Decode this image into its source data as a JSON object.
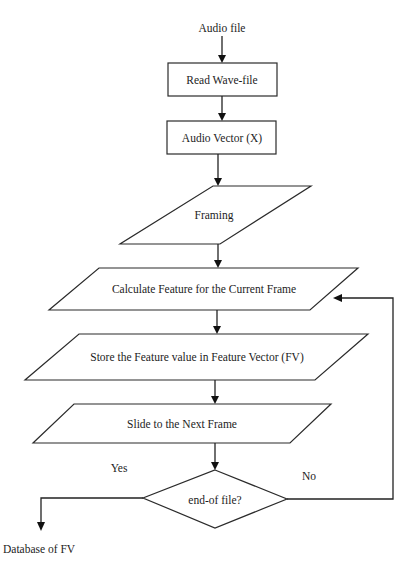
{
  "diagram": {
    "type": "flowchart",
    "colors": {
      "stroke": "#2b2b2b",
      "fill": "#ffffff",
      "text": "#1c1c1c"
    },
    "start_label": "Audio file",
    "nodes": [
      {
        "id": "read_wave",
        "shape": "rectangle",
        "label": "Read Wave-file"
      },
      {
        "id": "audio_vector",
        "shape": "rectangle",
        "label": "Audio Vector (X)"
      },
      {
        "id": "framing",
        "shape": "parallelogram",
        "label": "Framing"
      },
      {
        "id": "calc_feature",
        "shape": "parallelogram",
        "label": "Calculate Feature for the Current Frame"
      },
      {
        "id": "store_feature",
        "shape": "parallelogram",
        "label": "Store the Feature value in Feature Vector (FV)"
      },
      {
        "id": "slide_frame",
        "shape": "parallelogram",
        "label": "Slide to the Next Frame"
      },
      {
        "id": "end_of_file",
        "shape": "diamond",
        "label": "end-of file?"
      }
    ],
    "edges": [
      {
        "from": "start",
        "to": "read_wave",
        "label": ""
      },
      {
        "from": "read_wave",
        "to": "audio_vector",
        "label": ""
      },
      {
        "from": "audio_vector",
        "to": "framing",
        "label": ""
      },
      {
        "from": "framing",
        "to": "calc_feature",
        "label": ""
      },
      {
        "from": "calc_feature",
        "to": "store_feature",
        "label": ""
      },
      {
        "from": "store_feature",
        "to": "slide_frame",
        "label": ""
      },
      {
        "from": "slide_frame",
        "to": "end_of_file",
        "label": ""
      },
      {
        "from": "end_of_file",
        "to": "calc_feature",
        "label": "No"
      },
      {
        "from": "end_of_file",
        "to": "database",
        "label": "Yes"
      }
    ],
    "branch_labels": {
      "yes": "Yes",
      "no": "No"
    },
    "end_label": "Database of  FV"
  }
}
